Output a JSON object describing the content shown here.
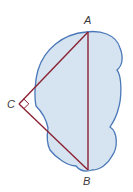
{
  "diagram": {
    "type": "geometry-figure",
    "colors": {
      "region_fill": "#d6e3f0",
      "region_stroke": "#4a78b8",
      "triangle_stroke": "#8b2232",
      "label": "#3a3a3a",
      "background": "#ffffff"
    },
    "vertices": {
      "A": {
        "label": "A",
        "x": 88,
        "y": 32
      },
      "B": {
        "label": "B",
        "x": 88,
        "y": 170
      },
      "C": {
        "label": "C",
        "x": 19,
        "y": 104
      }
    },
    "segments": [
      "AB",
      "AC",
      "CB"
    ],
    "right_angle_at": "C"
  }
}
